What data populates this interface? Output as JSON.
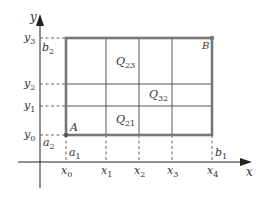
{
  "diagram": {
    "colors": {
      "axis": "#222222",
      "rect_border": "#777777",
      "grid": "#444444",
      "dashed": "#555555",
      "point": "#555555",
      "text": "#333333"
    },
    "axes": {
      "x_label": "x",
      "y_label": "y"
    },
    "x_ticks": [
      {
        "base": "x",
        "sub": "0"
      },
      {
        "base": "x",
        "sub": "1"
      },
      {
        "base": "x",
        "sub": "2"
      },
      {
        "base": "x",
        "sub": "3"
      },
      {
        "base": "x",
        "sub": "4"
      }
    ],
    "y_ticks": [
      {
        "base": "y",
        "sub": "0"
      },
      {
        "base": "y",
        "sub": "1"
      },
      {
        "base": "y",
        "sub": "2"
      },
      {
        "base": "y",
        "sub": "3"
      }
    ],
    "bounds": {
      "a1": {
        "base": "a",
        "sub": "1"
      },
      "a2": {
        "base": "a",
        "sub": "2"
      },
      "b1": {
        "base": "b",
        "sub": "1"
      },
      "b2": {
        "base": "b",
        "sub": "2"
      }
    },
    "points": {
      "A": "A",
      "B": "B"
    },
    "cells": [
      {
        "base": "Q",
        "sub": "23"
      },
      {
        "base": "Q",
        "sub": "32"
      },
      {
        "base": "Q",
        "sub": "21"
      }
    ]
  }
}
